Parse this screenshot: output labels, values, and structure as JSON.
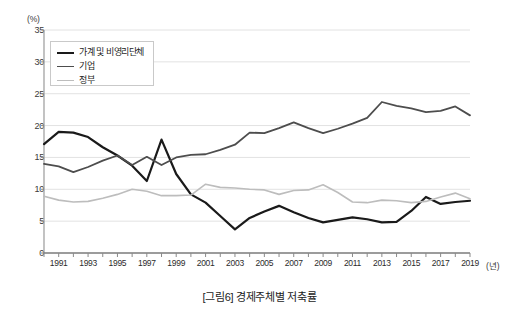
{
  "caption": "[그림6] 경제주체별 저축률",
  "axes": {
    "y_unit": "(%)",
    "x_unit": "(년)",
    "y_ticks": [
      "35",
      "30",
      "25",
      "20",
      "15",
      "10",
      "5",
      "0"
    ],
    "x_ticks": [
      "1991",
      "1993",
      "1995",
      "1997",
      "1999",
      "2001",
      "2003",
      "2005",
      "2007",
      "2009",
      "2011",
      "2013",
      "2015",
      "2017",
      "2019"
    ]
  },
  "legend": {
    "items": [
      {
        "label": "가계 및 비영리단체",
        "color": "#1a1a1a",
        "width": 2.2
      },
      {
        "label": "기업",
        "color": "#4d4d4d",
        "width": 1.8
      },
      {
        "label": "정부",
        "color": "#bdbdbd",
        "width": 1.6
      }
    ]
  },
  "chart_data": {
    "type": "line",
    "title": "[그림6] 경제주체별 저축률",
    "xlabel": "(년)",
    "ylabel": "(%)",
    "ylim": [
      0,
      35
    ],
    "xlim": [
      1990,
      2019
    ],
    "ytick_step": 5,
    "grid": true,
    "legend_position": "top-left",
    "x": [
      1990,
      1991,
      1992,
      1993,
      1994,
      1995,
      1996,
      1997,
      1998,
      1999,
      2000,
      2001,
      2002,
      2003,
      2004,
      2005,
      2006,
      2007,
      2008,
      2009,
      2010,
      2011,
      2012,
      2013,
      2014,
      2015,
      2016,
      2017,
      2018,
      2019
    ],
    "series": [
      {
        "name": "가계 및 비영리단체",
        "color": "#1a1a1a",
        "width": 2.2,
        "values": [
          17.1,
          19.0,
          18.9,
          18.2,
          16.6,
          15.3,
          13.7,
          11.3,
          17.8,
          12.4,
          9.2,
          7.9,
          5.8,
          3.7,
          5.5,
          6.5,
          7.4,
          6.4,
          5.5,
          4.8,
          5.2,
          5.6,
          5.3,
          4.8,
          4.9,
          6.6,
          8.8,
          7.7,
          8.0,
          8.2
        ]
      },
      {
        "name": "기업",
        "color": "#4d4d4d",
        "width": 1.8,
        "values": [
          14.0,
          13.6,
          12.7,
          13.5,
          14.5,
          15.3,
          13.8,
          15.1,
          13.8,
          15.0,
          15.4,
          15.5,
          16.2,
          17.0,
          18.9,
          18.8,
          19.6,
          20.5,
          19.6,
          18.8,
          19.5,
          20.3,
          21.2,
          23.7,
          23.1,
          22.7,
          22.1,
          22.3,
          23.0,
          21.6
        ]
      },
      {
        "name": "정부",
        "color": "#bdbdbd",
        "width": 1.6,
        "values": [
          8.9,
          8.3,
          8.0,
          8.1,
          8.6,
          9.2,
          10.0,
          9.7,
          9.0,
          9.0,
          9.1,
          10.8,
          10.3,
          10.2,
          10.0,
          9.9,
          9.2,
          9.8,
          9.9,
          10.7,
          9.5,
          8.0,
          7.9,
          8.3,
          8.2,
          7.9,
          8.1,
          8.8,
          9.4,
          8.5
        ]
      }
    ]
  }
}
